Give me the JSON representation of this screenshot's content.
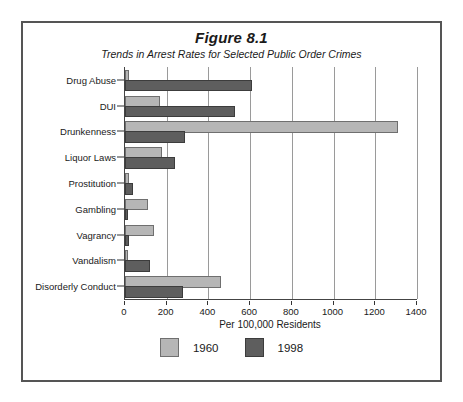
{
  "figure": {
    "title": "Figure 8.1",
    "subtitle": "Trends in Arrest Rates for Selected Public Order Crimes"
  },
  "axis": {
    "x_title": "Per 100,000 Residents",
    "ticks": [
      "0",
      "200",
      "400",
      "600",
      "800",
      "1000",
      "1200",
      "1400"
    ]
  },
  "legend": {
    "items": [
      {
        "label": "1960",
        "color": "#b6b6b6"
      },
      {
        "label": "1998",
        "color": "#5e5e5e"
      }
    ]
  },
  "colors": {
    "series_1960": "#b6b6b6",
    "series_1998": "#5e5e5e",
    "frame": "#555555",
    "gridline": "#9a9a9a"
  },
  "chart_data": {
    "type": "bar",
    "orientation": "horizontal",
    "title": "Figure 8.1",
    "subtitle": "Trends in Arrest Rates for Selected Public Order Crimes",
    "xlabel": "Per 100,000 Residents",
    "ylabel": "",
    "xlim": [
      0,
      1400
    ],
    "xticks": [
      0,
      200,
      400,
      600,
      800,
      1000,
      1200,
      1400
    ],
    "grid": true,
    "legend_position": "bottom",
    "categories": [
      "Drug Abuse",
      "DUI",
      "Drunkenness",
      "Liquor Laws",
      "Prostitution",
      "Gambling",
      "Vagrancy",
      "Vandalism",
      "Disorderly Conduct"
    ],
    "series": [
      {
        "name": "1960",
        "color": "#b6b6b6",
        "values": [
          10,
          160,
          1300,
          170,
          10,
          100,
          130,
          3,
          450
        ]
      },
      {
        "name": "1998",
        "color": "#5e5e5e",
        "values": [
          600,
          520,
          280,
          230,
          30,
          5,
          10,
          110,
          270
        ]
      }
    ]
  }
}
